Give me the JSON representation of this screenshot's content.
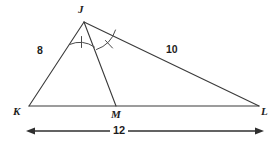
{
  "figure": {
    "background_color": "#ffffff",
    "line_color": "#3a3a3a",
    "text_color": "#1d1d1d"
  },
  "vertices": [
    {
      "key": "J",
      "label": "J",
      "x": 84,
      "y": 22,
      "label_x": 78,
      "label_y": 4
    },
    {
      "key": "K",
      "label": "K",
      "x": 29,
      "y": 106,
      "label_x": 13,
      "label_y": 106
    },
    {
      "key": "M",
      "label": "M",
      "x": 116,
      "y": 106,
      "label_x": 111,
      "label_y": 109
    },
    {
      "key": "L",
      "label": "L",
      "x": 259,
      "y": 106,
      "label_x": 261,
      "label_y": 106
    }
  ],
  "segments": [
    {
      "name": "JK",
      "from": "J",
      "to": "K"
    },
    {
      "name": "JL",
      "from": "J",
      "to": "L"
    },
    {
      "name": "KL",
      "from": "K",
      "to": "L"
    },
    {
      "name": "JM",
      "from": "J",
      "to": "M"
    }
  ],
  "side_labels": [
    {
      "name": "JK",
      "value": "8",
      "x": 37,
      "y": 45
    },
    {
      "name": "JL",
      "value": "10",
      "x": 166,
      "y": 44
    }
  ],
  "angle_marks": [
    {
      "name": "angle-KJM",
      "ticks": 1,
      "tick_style": "vertical"
    },
    {
      "name": "angle-MJL",
      "ticks": 1,
      "tick_style": "slanted"
    }
  ],
  "dimension": {
    "name": "KL",
    "value": "12",
    "label_x": 117,
    "label_y": 125,
    "y": 131,
    "x_start": 26,
    "x_end": 264
  }
}
